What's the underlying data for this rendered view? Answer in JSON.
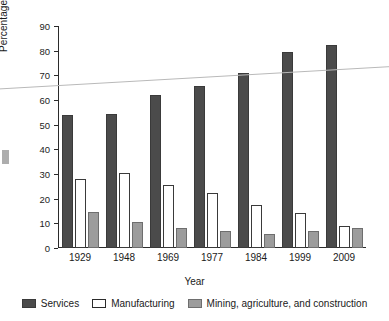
{
  "chart_data": {
    "type": "bar",
    "title": "",
    "xlabel": "Year",
    "ylabel": "Percentage of U.S. Labor Force",
    "categories": [
      "1929",
      "1948",
      "1969",
      "1977",
      "1984",
      "1999",
      "2009"
    ],
    "series": [
      {
        "name": "Services",
        "color": "#4b4b4b",
        "values": [
          54,
          54.5,
          62,
          65.5,
          71,
          79.5,
          82.5
        ]
      },
      {
        "name": "Manufacturing",
        "color": "#ffffff",
        "values": [
          28,
          30.5,
          25.5,
          22.5,
          17.5,
          14,
          9
        ]
      },
      {
        "name": "Mining, agriculture, and construction",
        "color": "#9c9c9c",
        "values": [
          14.5,
          10.5,
          8,
          7,
          5.5,
          7,
          8
        ]
      }
    ],
    "ylim": [
      0,
      90
    ],
    "ytick_step": 10,
    "yticks": [
      "0",
      "10",
      "20",
      "30",
      "40",
      "50",
      "60",
      "70",
      "80",
      "90"
    ],
    "grid": false,
    "legend_position": "bottom",
    "annotations": [
      {
        "name": "trend-line",
        "description": "faint ascending straight line crossing the plot",
        "y_left": 64.5,
        "y_right": 73.5
      }
    ]
  },
  "legend": {
    "items": [
      {
        "label": "Services",
        "swatch": "services"
      },
      {
        "label": "Manufacturing",
        "swatch": "manufacturing"
      },
      {
        "label": "Mining, agriculture, and construction",
        "swatch": "mining"
      }
    ]
  },
  "axes": {
    "y_title": "Percentage of U.S. Labor Force",
    "x_title": "Year"
  }
}
